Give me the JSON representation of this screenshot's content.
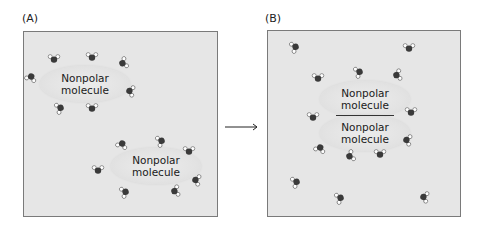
{
  "panels": {
    "a": {
      "label": "(A)",
      "molecules": [
        {
          "text_line1": "Nonpolar",
          "text_line2": "molecule"
        },
        {
          "text_line1": "Nonpolar",
          "text_line2": "molecule"
        }
      ]
    },
    "b": {
      "label": "(B)",
      "molecules": [
        {
          "text_line1": "Nonpolar",
          "text_line2": "molecule"
        },
        {
          "text_line1": "Nonpolar",
          "text_line2": "molecule"
        }
      ]
    }
  },
  "colors": {
    "panel_bg": "#e6e6e6",
    "panel_border": "#7a7a7a",
    "oxygen": "#3a3a3a",
    "hydrogen": "#ffffff",
    "arrow": "#222222"
  }
}
